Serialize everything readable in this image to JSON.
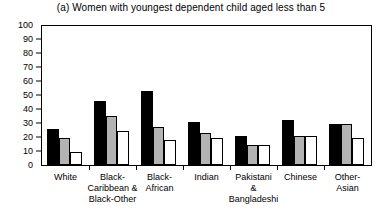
{
  "chart_data": {
    "type": "bar",
    "title": "(a) Women with youngest dependent child aged less than 5",
    "xlabel": "",
    "ylabel": "",
    "ylim": [
      0,
      100
    ],
    "yticks": [
      0,
      10,
      20,
      30,
      40,
      50,
      60,
      70,
      80,
      90,
      100
    ],
    "grid": false,
    "legend": "none",
    "categories": [
      "White",
      "Black-\nCaribbean &\nBlack-Other",
      "Black-\nAfrican",
      "Indian",
      "Pakistani\n&\nBangladeshi",
      "Chinese",
      "Other-\nAsian"
    ],
    "series": [
      {
        "name": "series-1",
        "color": "#000000",
        "values": [
          26,
          46,
          53,
          31,
          21,
          32,
          29
        ]
      },
      {
        "name": "series-2",
        "color": "#b3b3b3",
        "values": [
          19,
          35,
          27,
          23,
          14,
          21,
          29
        ]
      },
      {
        "name": "series-3",
        "color": "#ffffff",
        "values": [
          9,
          24,
          18,
          19,
          14,
          21,
          19
        ]
      }
    ]
  }
}
